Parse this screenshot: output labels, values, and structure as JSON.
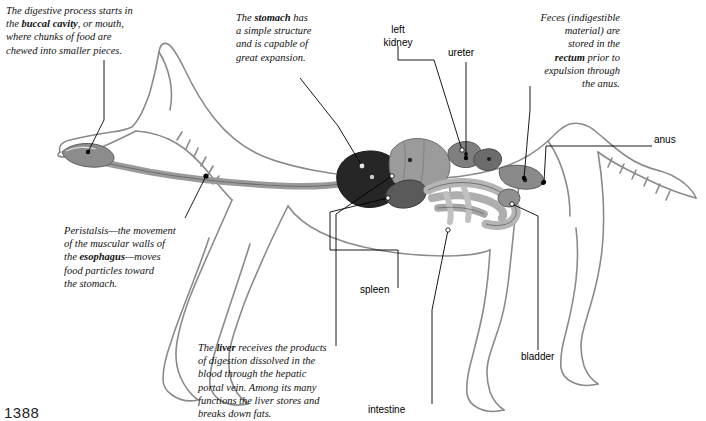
{
  "figure": {
    "page_number": "1388",
    "colors": {
      "outline": "#8a8a8a",
      "leader_line": "#000000",
      "stomach": "#2b2b2b",
      "liver": "#8d8d8d",
      "spleen": "#575757",
      "intestine": "#b8b8b8",
      "esophagus": "#a8a8a8",
      "text": "#111111"
    }
  },
  "annotations": [
    {
      "id": "buccal-cavity",
      "lines": [
        {
          "text": "The digestive process starts in "
        },
        {
          "text": "the ",
          "bold_after": "buccal cavity",
          "tail": ", or mouth,"
        },
        {
          "text": "where chunks of food are"
        },
        {
          "text": "chewed into smaller pieces."
        }
      ],
      "plain": "The digestive process starts in the buccal cavity, or mouth, where chunks of food are chewed into smaller pieces."
    },
    {
      "id": "stomach",
      "plain": "The stomach has a simple structure and is capable of great expansion."
    },
    {
      "id": "feces-rectum",
      "plain": "Feces (indigestible material) are stored in the rectum prior to expulsion through the anus."
    },
    {
      "id": "peristalsis",
      "plain": "Peristalsis—the movement of the muscular walls of the esophagus—moves food particles toward the stomach."
    },
    {
      "id": "liver",
      "plain": "The liver receives the products of digestion dissolved in the blood through the hepatic portal vein. Among its many functions the liver stores and breaks down fats."
    }
  ],
  "annotation_text": {
    "buccal_cavity": {
      "l1": "The digestive process starts in",
      "l2a": "the ",
      "l2b": "buccal cavity",
      "l2c": ", or mouth,",
      "l3": "where chunks of food are",
      "l4": "chewed into smaller pieces."
    },
    "stomach": {
      "l1a": "The ",
      "l1b": "stomach",
      "l1c": " has",
      "l2": "a simple structure",
      "l3": "and is capable of",
      "l4": "great expansion."
    },
    "feces": {
      "l1": "Feces (indigestible",
      "l2": "material) are",
      "l3": "stored in the",
      "l4a": "rectum",
      "l4b": " prior to",
      "l5": "expulsion through",
      "l6": "the anus."
    },
    "peristalsis": {
      "l1": "Peristalsis—the movement",
      "l2": "of the muscular walls of",
      "l3a": "the ",
      "l3b": "esophagus",
      "l3c": "—moves",
      "l4": "food particles toward",
      "l5": "the stomach."
    },
    "liver": {
      "l1a": "The ",
      "l1b": "liver",
      "l1c": " receives the products",
      "l2": "of digestion dissolved in the",
      "l3": "blood through the hepatic",
      "l4": "portal vein. Among its many",
      "l5": "functions the liver stores and",
      "l6": "breaks down fats."
    }
  },
  "part_labels": [
    {
      "id": "left-kidney",
      "line1": "left",
      "line2": "kidney"
    },
    {
      "id": "ureter",
      "line1": "ureter"
    },
    {
      "id": "anus",
      "line1": "anus"
    },
    {
      "id": "spleen",
      "line1": "spleen"
    },
    {
      "id": "bladder",
      "line1": "bladder"
    },
    {
      "id": "intestine",
      "line1": "intestine"
    }
  ],
  "labels": {
    "left_kidney_l1": "left",
    "left_kidney_l2": "kidney",
    "ureter": "ureter",
    "anus": "anus",
    "spleen": "spleen",
    "bladder": "bladder",
    "intestine": "intestine"
  }
}
